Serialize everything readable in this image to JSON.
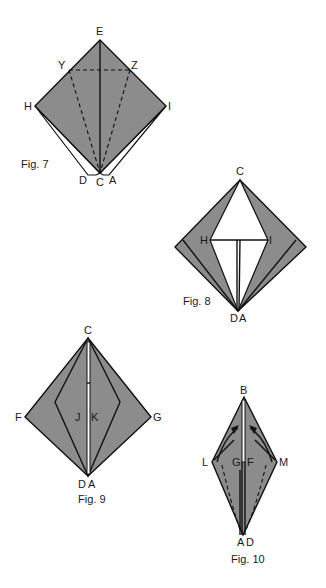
{
  "colors": {
    "shade": "#8c8c8c",
    "ink": "#111111",
    "paper": "#ffffff"
  },
  "figures": [
    {
      "caption": "Fig. 7",
      "labels": {
        "E": "E",
        "Y": "Y",
        "Z": "Z",
        "H": "H",
        "I": "I",
        "D": "D",
        "C": "C",
        "A": "A"
      }
    },
    {
      "caption": "Fig. 8",
      "labels": {
        "C": "C",
        "H": "H",
        "I": "I",
        "D": "D",
        "A": "A"
      }
    },
    {
      "caption": "Fig. 9",
      "labels": {
        "C": "C",
        "F": "F",
        "G": "G",
        "J": "J",
        "K": "K",
        "D": "D",
        "A": "A"
      }
    },
    {
      "caption": "Fig. 10",
      "labels": {
        "B": "B",
        "L": "L",
        "M": "M",
        "G": "G",
        "F": "F",
        "A": "A",
        "D": "D"
      }
    }
  ]
}
